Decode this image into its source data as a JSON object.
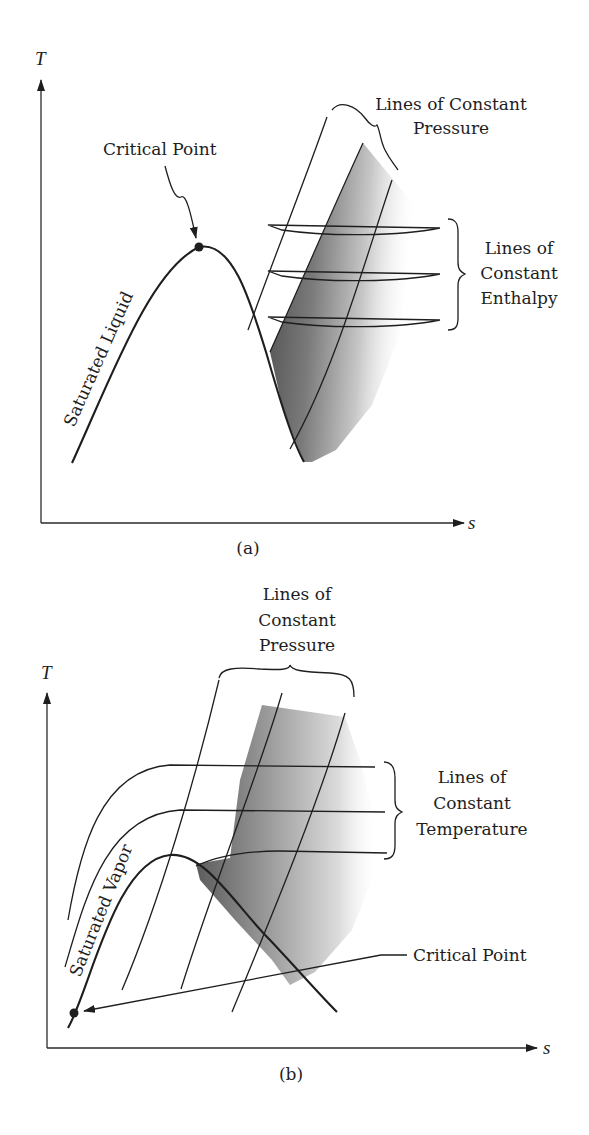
{
  "figure": {
    "panels": [
      {
        "id": "a",
        "caption": "(a)",
        "axes": {
          "x_label": "s",
          "y_label": "T"
        },
        "labels": {
          "critical_point": "Critical Point",
          "saturated_curve": "Saturated Liquid",
          "pressure_lines_line1": "Lines of Constant",
          "pressure_lines_line2": "Pressure",
          "enthalpy_lines_line1": "Lines of",
          "enthalpy_lines_line2": "Constant",
          "enthalpy_lines_line3": "Enthalpy"
        }
      },
      {
        "id": "b",
        "caption": "(b)",
        "axes": {
          "x_label": "s",
          "y_label": "T"
        },
        "labels": {
          "critical_point": "Critical Point",
          "saturated_curve": "Saturated Vapor",
          "pressure_lines_line1": "Lines of",
          "pressure_lines_line2": "Constant",
          "pressure_lines_line3": "Pressure",
          "temperature_lines_line1": "Lines of",
          "temperature_lines_line2": "Constant",
          "temperature_lines_line3": "Temperature"
        }
      }
    ],
    "colors": {
      "ink": "#1e1e1e",
      "shade_dark": "#5a5a5a",
      "shade_light": "#ffffff"
    }
  }
}
